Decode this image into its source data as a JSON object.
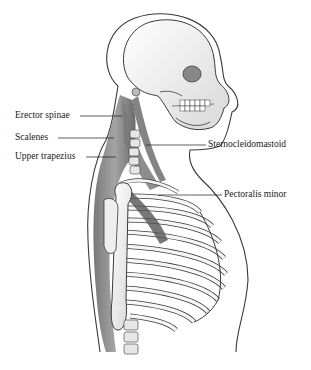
{
  "diagram": {
    "labels": [
      {
        "id": "erector-spinae",
        "text": "Erector spinae",
        "side": "left"
      },
      {
        "id": "scalenes",
        "text": "Scalenes",
        "side": "left"
      },
      {
        "id": "upper-trapezius",
        "text": "Upper trapezius",
        "side": "left"
      },
      {
        "id": "sternocleidomastoid",
        "text": "Sternocleidomastoid",
        "side": "right"
      },
      {
        "id": "pectoralis-minor",
        "text": "Pectoralis minor",
        "side": "right"
      }
    ],
    "colors": {
      "bone": "#f4f4f4",
      "outline": "#3a3a3a",
      "muscle": "#8a8a8a",
      "muscle_dark": "#5c5c5c",
      "text": "#1a1a1a"
    }
  }
}
